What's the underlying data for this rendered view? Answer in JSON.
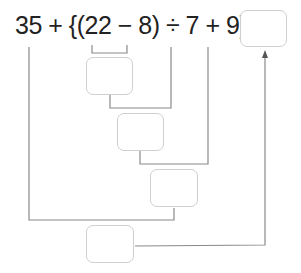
{
  "expression": {
    "text": "35 + {(22 − 8) ÷ 7 + 9} =",
    "terms": [
      "35",
      "+",
      "{(",
      "22",
      "−",
      "8",
      ")",
      "÷",
      "7",
      "+",
      "9",
      "}",
      "="
    ]
  },
  "boxes": [
    {
      "id": "answer",
      "value": ""
    },
    {
      "id": "step1-22-minus-8",
      "value": ""
    },
    {
      "id": "step2-divide-7",
      "value": ""
    },
    {
      "id": "step3-plus-9",
      "value": ""
    },
    {
      "id": "step4-35-plus",
      "value": ""
    }
  ],
  "colors": {
    "line": "#8a8a8a",
    "box_border": "#cfcfcf",
    "text": "#222222"
  }
}
